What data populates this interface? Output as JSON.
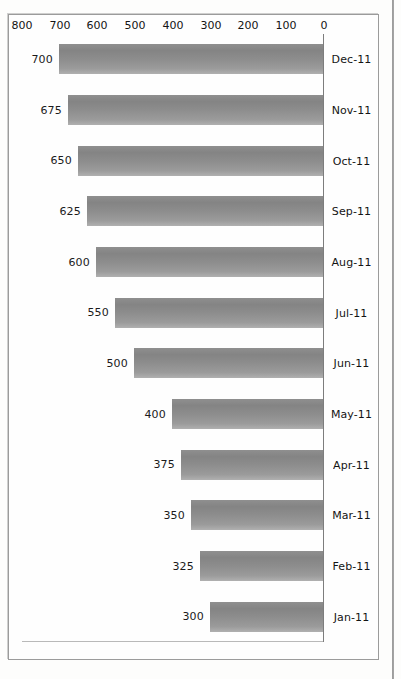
{
  "chart_data": {
    "type": "bar",
    "orientation": "horizontal",
    "title": "",
    "xlabel": "",
    "ylabel": "",
    "categories": [
      "Jan-11",
      "Feb-11",
      "Mar-11",
      "Apr-11",
      "May-11",
      "Jun-11",
      "Jul-11",
      "Aug-11",
      "Sep-11",
      "Oct-11",
      "Nov-11",
      "Dec-11"
    ],
    "values": [
      300,
      325,
      350,
      375,
      400,
      500,
      550,
      600,
      625,
      650,
      675,
      700
    ],
    "data_labels": [
      "300",
      "325",
      "350",
      "375",
      "400",
      "500",
      "550",
      "600",
      "625",
      "650",
      "675",
      "700"
    ],
    "axis_ticks": [
      "0",
      "100",
      "200",
      "300",
      "400",
      "500",
      "600",
      "700",
      "800"
    ],
    "axis_tick_values": [
      0,
      100,
      200,
      300,
      400,
      500,
      600,
      700,
      800
    ],
    "xlim": [
      0,
      800
    ],
    "grid": false,
    "legend": false,
    "bar_color": "#8d8d8d",
    "axis_color": "#7d7d7d",
    "text_color": "#141414",
    "rotation_degrees": 180
  }
}
